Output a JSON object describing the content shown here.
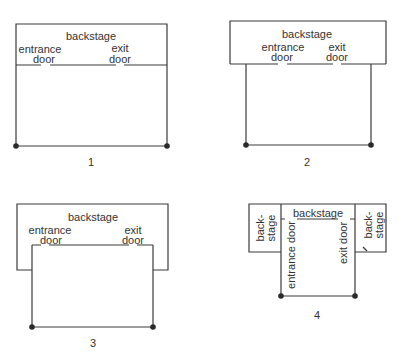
{
  "diagrams": [
    {
      "id": 1,
      "number": "1",
      "backstage": "backstage",
      "entrance": [
        "entrance",
        "door"
      ],
      "exit": [
        "exit",
        "door"
      ]
    },
    {
      "id": 2,
      "number": "2",
      "backstage": "backstage",
      "entrance": [
        "entrance",
        "door"
      ],
      "exit": [
        "exit",
        "door"
      ]
    },
    {
      "id": 3,
      "number": "3",
      "backstage": "backstage",
      "entrance": [
        "entrance",
        "door"
      ],
      "exit": [
        "exit",
        "door"
      ]
    },
    {
      "id": 4,
      "number": "4",
      "backstage": "backstage",
      "side_backstage_left": [
        "back-",
        "stage"
      ],
      "side_backstage_right": [
        "back-",
        "stage"
      ],
      "entrance": "entrance door",
      "exit": "exit door"
    }
  ],
  "colors": {
    "line": "#3a3a3a",
    "dot": "#2a2a2a",
    "text": "#333333"
  }
}
